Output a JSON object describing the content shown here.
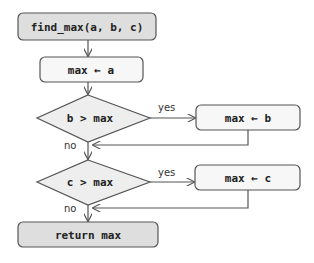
{
  "diagram": {
    "type": "flowchart",
    "colors": {
      "terminal_fill": "#dedede",
      "process_fill": "#f7f7f7",
      "decision_fill": "#eeeeee",
      "stroke": "#555555"
    },
    "nodes": {
      "start": {
        "label": "find_max(a, b, c)",
        "kind": "terminal"
      },
      "init": {
        "label": "max ← a",
        "kind": "process"
      },
      "cond1": {
        "label": "b > max",
        "kind": "decision"
      },
      "assign_b": {
        "label": "max ← b",
        "kind": "process"
      },
      "cond2": {
        "label": "c > max",
        "kind": "decision"
      },
      "assign_c": {
        "label": "max ← c",
        "kind": "process"
      },
      "end": {
        "label": "return max",
        "kind": "terminal"
      }
    },
    "edges": [
      {
        "from": "start",
        "to": "init",
        "label": ""
      },
      {
        "from": "init",
        "to": "cond1",
        "label": ""
      },
      {
        "from": "cond1",
        "to": "assign_b",
        "label": "yes"
      },
      {
        "from": "cond1",
        "to": "cond2",
        "label": "no"
      },
      {
        "from": "assign_b",
        "to": "cond2",
        "label": ""
      },
      {
        "from": "cond2",
        "to": "assign_c",
        "label": "yes"
      },
      {
        "from": "cond2",
        "to": "end",
        "label": "no"
      },
      {
        "from": "assign_c",
        "to": "end",
        "label": ""
      }
    ],
    "edge_labels": {
      "yes1": "yes",
      "no1": "no",
      "yes2": "yes",
      "no2": "no"
    }
  }
}
